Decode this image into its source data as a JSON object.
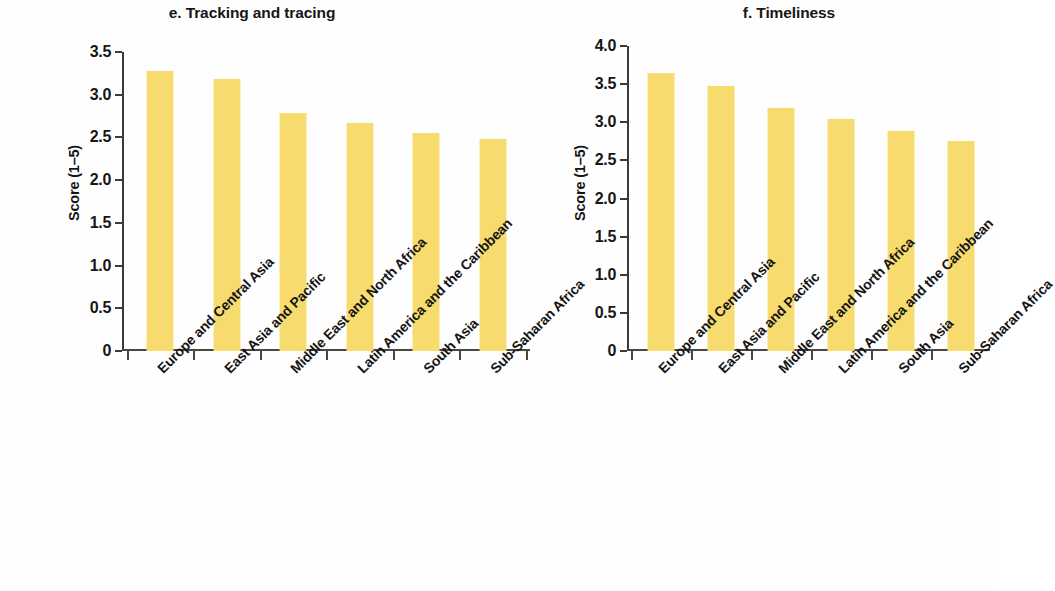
{
  "figure": {
    "background": "#ffffff",
    "bar_color": "#F7DB6E",
    "axis_color": "#3a3a36"
  },
  "panels": [
    {
      "id": "e",
      "title": "e. Tracking and tracing",
      "axis_title": "Score (1–5)"
    },
    {
      "id": "f",
      "title": "f. Timeliness",
      "axis_title": "Score (1–5)"
    }
  ],
  "chart_data": [
    {
      "type": "bar",
      "title": "e. Tracking and tracing",
      "xlabel": "",
      "ylabel": "Score (1–5)",
      "ylim": [
        0,
        3.5
      ],
      "yticks": [
        0,
        0.5,
        1.0,
        1.5,
        2.0,
        2.5,
        3.0,
        3.5
      ],
      "ytick_labels": [
        "0",
        "0.5",
        "1.0",
        "1.5",
        "2.0",
        "2.5",
        "3.0",
        "3.5"
      ],
      "grid": false,
      "legend": "none",
      "categories": [
        "Europe and Central Asia",
        "East Asia and Pacific",
        "Middle East and North Africa",
        "Latin America and the Caribbean",
        "South Asia",
        "Sub-Saharan Africa"
      ],
      "values": [
        3.28,
        3.18,
        2.79,
        2.67,
        2.55,
        2.48
      ]
    },
    {
      "type": "bar",
      "title": "f. Timeliness",
      "xlabel": "",
      "ylabel": "Score (1–5)",
      "ylim": [
        0,
        4.0
      ],
      "yticks": [
        0,
        0.5,
        1.0,
        1.5,
        2.0,
        2.5,
        3.0,
        3.5,
        4.0
      ],
      "ytick_labels": [
        "0",
        "0.5",
        "1.0",
        "1.5",
        "2.0",
        "2.5",
        "3.0",
        "3.5",
        "4.0"
      ],
      "grid": false,
      "legend": "none",
      "categories": [
        "Europe and Central Asia",
        "East Asia and Pacific",
        "Middle East and North Africa",
        "Latin America and the Caribbean",
        "South Asia",
        "Sub-Saharan Africa"
      ],
      "values": [
        3.65,
        3.48,
        3.19,
        3.04,
        2.89,
        2.75
      ]
    }
  ]
}
